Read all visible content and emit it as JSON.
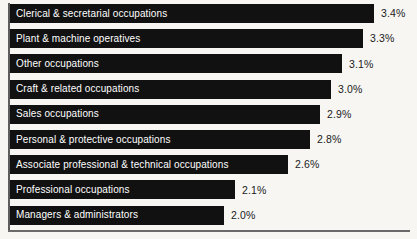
{
  "chart_data": {
    "type": "bar",
    "orientation": "horizontal",
    "title": "",
    "xlabel": "",
    "ylabel": "",
    "grid": false,
    "legend": null,
    "value_suffix": "%",
    "xlim": [
      0,
      3.6
    ],
    "categories": [
      "Clerical & secretarial occupations",
      "Plant & machine operatives",
      "Other occupations",
      "Craft & related occupations",
      "Sales occupations",
      "Personal & protective occupations",
      "Associate professional & technical occupations",
      "Professional occupations",
      "Managers & administrators"
    ],
    "values": [
      3.4,
      3.3,
      3.1,
      3.0,
      2.9,
      2.8,
      2.6,
      2.1,
      2.0
    ],
    "value_labels": [
      "3.4%",
      "3.3%",
      "3.1%",
      "3.0%",
      "2.9%",
      "2.8%",
      "2.6%",
      "2.1%",
      "2.0%"
    ],
    "bars": [
      {
        "label": "Clerical & secretarial occupations",
        "value": 3.4,
        "value_label": "3.4%"
      },
      {
        "label": "Plant & machine operatives",
        "value": 3.3,
        "value_label": "3.3%"
      },
      {
        "label": "Other occupations",
        "value": 3.1,
        "value_label": "3.1%"
      },
      {
        "label": "Craft & related occupations",
        "value": 3.0,
        "value_label": "3.0%"
      },
      {
        "label": "Sales occupations",
        "value": 2.9,
        "value_label": "2.9%"
      },
      {
        "label": "Personal & protective occupations",
        "value": 2.8,
        "value_label": "2.8%"
      },
      {
        "label": "Associate professional & technical occupations",
        "value": 2.6,
        "value_label": "2.6%"
      },
      {
        "label": "Professional occupations",
        "value": 2.1,
        "value_label": "2.1%"
      },
      {
        "label": "Managers & administrators",
        "value": 2.0,
        "value_label": "2.0%"
      }
    ],
    "colors": {
      "bar": "#111111",
      "bar_label_text": "#ffffff",
      "value_label_text": "#1a1a1a",
      "background": "#f7f6f3",
      "axis": "#5d5d5d"
    }
  }
}
